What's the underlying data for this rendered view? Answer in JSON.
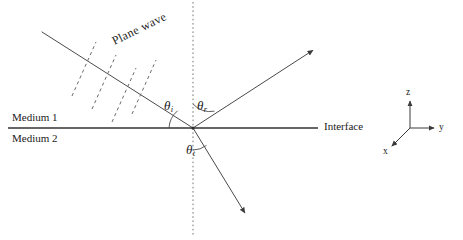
{
  "figure": {
    "kind": "optics-ray-diagram",
    "line_color": "#3a3a3a",
    "text_color": "#1a1a1a",
    "background": "#ffffff"
  },
  "labels": {
    "plane_wave": "Plane wave",
    "medium_upper": "Medium 1",
    "medium_lower": "Medium 2",
    "interface": "Interface"
  },
  "angles": {
    "incident": {
      "symbol": "θ",
      "subscript": "i"
    },
    "reflected": {
      "symbol": "θ",
      "subscript": "r"
    },
    "transmitted": {
      "symbol": "θ",
      "subscript": "t"
    }
  },
  "axes": {
    "z": "z",
    "y": "y",
    "x": "x"
  },
  "geometry": {
    "origin": {
      "x": 193,
      "y": 128
    },
    "interface_line": {
      "x1": 8,
      "y1": 128,
      "x2": 318,
      "y2": 128
    },
    "normal_line": {
      "x1": 193,
      "y1": 2,
      "x2": 193,
      "y2": 236
    },
    "incident_ray": {
      "x1": 42,
      "y1": 32,
      "x2": 193,
      "y2": 128
    },
    "reflected_ray": {
      "x1": 193,
      "y1": 128,
      "x2": 318,
      "y2": 47
    },
    "transmitted_ray": {
      "x1": 193,
      "y1": 128,
      "x2": 248,
      "y2": 218
    },
    "wavefronts": [
      {
        "x1": 72,
        "y1": 96,
        "x2": 96,
        "y2": 42
      },
      {
        "x1": 92,
        "y1": 109,
        "x2": 116,
        "y2": 55
      },
      {
        "x1": 112,
        "y1": 122,
        "x2": 136,
        "y2": 68
      },
      {
        "x1": 132,
        "y1": 114,
        "x2": 156,
        "y2": 60
      }
    ],
    "axis_triad": {
      "origin": {
        "x": 410,
        "y": 128
      },
      "z_end": {
        "x": 410,
        "y": 97
      },
      "y_end": {
        "x": 438,
        "y": 128
      },
      "x_end": {
        "x": 389,
        "y": 149
      }
    }
  }
}
